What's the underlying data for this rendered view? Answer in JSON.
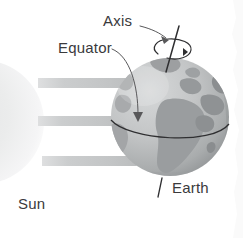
{
  "figure": {
    "background_color": "#ffffff"
  },
  "labels": {
    "axis": "Axis",
    "equator": "Equator",
    "earth": "Earth",
    "sun": "Sun"
  },
  "colors": {
    "text": "#3a3a3c",
    "line": "#2f2f31",
    "globe_light": "#cfd1d2",
    "globe_mid": "#b3b5b6",
    "globe_dark": "#8e9193",
    "land": "#9b9ea0",
    "land_dark": "#86898b",
    "sun_fill": "#ededee",
    "ray": "#c9cbcc",
    "paper_edge": "#f2f2f2"
  },
  "elements": {
    "sun": {
      "name": "sun-circle",
      "cx": -18,
      "cy": 122,
      "r": 62
    },
    "globe": {
      "name": "earth-globe",
      "cx": 170,
      "cy": 117,
      "r": 59
    },
    "rays": [
      {
        "name": "sun-ray-top",
        "y": 78,
        "height": 10,
        "x1": 38,
        "x2": 135
      },
      {
        "name": "sun-ray-middle",
        "y": 116,
        "height": 10,
        "x1": 38,
        "x2": 130
      },
      {
        "name": "sun-ray-bottom",
        "y": 156,
        "height": 10,
        "x1": 42,
        "x2": 138
      }
    ],
    "axis_line": {
      "name": "rotation-axis",
      "tilt_degrees": 23
    },
    "equator_line": {
      "name": "equator-line"
    },
    "rotation_arrow": {
      "name": "rotation-direction-arrow"
    }
  }
}
